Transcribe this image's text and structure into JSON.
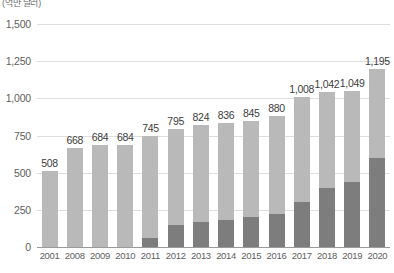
{
  "axis": {
    "unit_label": "(억만 달러)",
    "y_ticks": [
      "0",
      "250",
      "500",
      "750",
      "1,000",
      "1,250",
      "1,500"
    ]
  },
  "colors": {
    "total_bar": "#b9b9b9",
    "sub_bar": "#7d7d7d",
    "gridline": "#dedede",
    "baseline": "#9a9a9a",
    "value_text": "#3d3d3d",
    "tick_text": "#5e5e5e"
  },
  "chart_data": {
    "type": "bar",
    "title": "",
    "xlabel": "",
    "ylabel": "(억만 달러)",
    "ylim": [
      0,
      1500
    ],
    "ytick_values": [
      0,
      250,
      500,
      750,
      1000,
      1250,
      1500
    ],
    "grid": true,
    "legend": "none",
    "categories": [
      "2001",
      "2008",
      "2009",
      "2010",
      "2011",
      "2012",
      "2013",
      "2014",
      "2015",
      "2016",
      "2017",
      "2018",
      "2019",
      "2020"
    ],
    "series": [
      {
        "name": "total",
        "values": [
          508,
          668,
          684,
          684,
          745,
          795,
          824,
          836,
          845,
          880,
          1008,
          1042,
          1049,
          1195
        ],
        "labels": [
          "508",
          "668",
          "684",
          "684",
          "745",
          "795",
          "824",
          "836",
          "845",
          "880",
          "1,008",
          "1,042",
          "1,049",
          "1,195"
        ]
      },
      {
        "name": "sub",
        "values": [
          0,
          0,
          0,
          0,
          60,
          150,
          170,
          185,
          200,
          225,
          300,
          395,
          440,
          600
        ],
        "labels": [
          "",
          "",
          "",
          "",
          "",
          "",
          "",
          "",
          "",
          "",
          "",
          "",
          "",
          ""
        ]
      }
    ]
  }
}
